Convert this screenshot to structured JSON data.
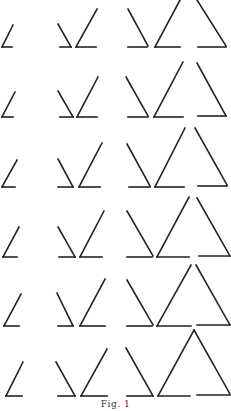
{
  "figure": {
    "caption": "Fig. 1",
    "ink_color": "#222222",
    "background": "#ffffff",
    "rows": [
      {
        "small": [
          [
            13,
            25
          ],
          [
            2,
            47
          ],
          [
            12,
            47
          ]
        ],
        "pair_left": {
          "slant": [
            [
              58,
              24
            ],
            [
              71,
              47
            ]
          ],
          "base": [
            [
              60,
              47
            ],
            [
              71,
              47
            ]
          ]
        },
        "pair_right": {
          "slant": [
            [
              97,
              9
            ],
            [
              76,
              47
            ]
          ],
          "base": [
            [
              76,
              47
            ],
            [
              96,
              47
            ]
          ]
        },
        "tri_left": {
          "slant": [
            [
              128,
              9
            ],
            [
              148,
              46
            ]
          ],
          "base": [
            [
              128,
              47
            ],
            [
              147,
              47
            ]
          ]
        },
        "tri_mid": {
          "slant": [
            [
              180,
              0
            ],
            [
              155,
              47
            ]
          ],
          "base": [
            [
              155,
              47
            ],
            [
              180,
              47
            ]
          ]
        },
        "tri_right": {
          "slant": [
            [
              197,
              0
            ],
            [
              226,
              46
            ]
          ],
          "base": [
            [
              198,
              47
            ],
            [
              226,
              47
            ]
          ]
        }
      },
      {
        "small": [
          [
            15,
            92
          ],
          [
            2,
            117
          ],
          [
            13,
            117
          ]
        ],
        "pair_left": {
          "slant": [
            [
              58,
              91
            ],
            [
              73,
              117
            ]
          ],
          "base": [
            [
              60,
              117
            ],
            [
              73,
              117
            ]
          ]
        },
        "pair_right": {
          "slant": [
            [
              98,
              77
            ],
            [
              77,
              117
            ]
          ],
          "base": [
            [
              77,
              117
            ],
            [
              97,
              117
            ]
          ]
        },
        "tri_left": {
          "slant": [
            [
              126,
              77
            ],
            [
              148,
              116
            ]
          ],
          "base": [
            [
              128,
              117
            ],
            [
              148,
              117
            ]
          ]
        },
        "tri_mid": {
          "slant": [
            [
              183,
              62
            ],
            [
              154,
              117
            ]
          ],
          "base": [
            [
              154,
              117
            ],
            [
              183,
              117
            ]
          ]
        },
        "tri_right": {
          "slant": [
            [
              197,
              63
            ],
            [
              226,
              116
            ]
          ],
          "base": [
            [
              198,
              116
            ],
            [
              226,
              116
            ]
          ]
        }
      },
      {
        "small": [
          [
            17,
            160
          ],
          [
            2,
            187
          ],
          [
            15,
            187
          ]
        ],
        "pair_left": {
          "slant": [
            [
              58,
              159
            ],
            [
              73,
              187
            ]
          ],
          "base": [
            [
              58,
              187
            ],
            [
              73,
              187
            ]
          ]
        },
        "pair_right": {
          "slant": [
            [
              102,
              143
            ],
            [
              79,
              187
            ]
          ],
          "base": [
            [
              79,
              187
            ],
            [
              100,
              187
            ]
          ]
        },
        "tri_left": {
          "slant": [
            [
              127,
              144
            ],
            [
              150,
              186
            ]
          ],
          "base": [
            [
              129,
              187
            ],
            [
              150,
              187
            ]
          ]
        },
        "tri_mid": {
          "slant": [
            [
              185,
              128
            ],
            [
              155,
              187
            ]
          ],
          "base": [
            [
              155,
              187
            ],
            [
              184,
              187
            ]
          ]
        },
        "tri_right": {
          "slant": [
            [
              195,
              128
            ],
            [
              227,
              185
            ]
          ],
          "base": [
            [
              198,
              186
            ],
            [
              227,
              186
            ]
          ]
        }
      },
      {
        "small": [
          [
            19,
            227
          ],
          [
            3,
            257
          ],
          [
            17,
            257
          ]
        ],
        "pair_left": {
          "slant": [
            [
              58,
              227
            ],
            [
              75,
              257
            ]
          ],
          "base": [
            [
              59,
              257
            ],
            [
              75,
              257
            ]
          ]
        },
        "pair_right": {
          "slant": [
            [
              104,
              211
            ],
            [
              80,
              257
            ]
          ],
          "base": [
            [
              80,
              257
            ],
            [
              102,
              257
            ]
          ]
        },
        "tri_left": {
          "slant": [
            [
              127,
              211
            ],
            [
              153,
              256
            ]
          ],
          "base": [
            [
              127,
              257
            ],
            [
              152,
              257
            ]
          ]
        },
        "tri_mid": {
          "slant": [
            [
              189,
              197
            ],
            [
              157,
              257
            ]
          ],
          "base": [
            [
              157,
              257
            ],
            [
              189,
              257
            ]
          ]
        },
        "tri_right": {
          "slant": [
            [
              197,
              198
            ],
            [
              230,
              256
            ]
          ],
          "base": [
            [
              199,
              256
            ],
            [
              230,
              256
            ]
          ]
        }
      },
      {
        "small": [
          [
            21,
            294
          ],
          [
            4,
            326
          ],
          [
            19,
            326
          ]
        ],
        "pair_left": {
          "slant": [
            [
              57,
              293
            ],
            [
              73,
              326
            ]
          ],
          "base": [
            [
              58,
              326
            ],
            [
              73,
              326
            ]
          ]
        },
        "pair_right": {
          "slant": [
            [
              105,
              279
            ],
            [
              80,
              326
            ]
          ],
          "base": [
            [
              80,
              326
            ],
            [
              105,
              326
            ]
          ]
        },
        "tri_left": {
          "slant": [
            [
              127,
              280
            ],
            [
              153,
              325
            ]
          ],
          "base": [
            [
              127,
              326
            ],
            [
              152,
              326
            ]
          ]
        },
        "tri_mid": {
          "slant": [
            [
              191,
              265
            ],
            [
              157,
              326
            ]
          ],
          "base": [
            [
              157,
              326
            ],
            [
              191,
              326
            ]
          ]
        },
        "tri_right": {
          "slant": [
            [
              196,
              265
            ],
            [
              230,
              325
            ]
          ],
          "base": [
            [
              197,
              325
            ],
            [
              230,
              325
            ]
          ]
        }
      },
      {
        "small": [
          [
            23,
            362
          ],
          [
            6,
            396
          ],
          [
            22,
            396
          ]
        ],
        "pair_left": {
          "slant": [
            [
              56,
              362
            ],
            [
              75,
              396
            ]
          ],
          "base": [
            [
              58,
              396
            ],
            [
              75,
              396
            ]
          ]
        },
        "pair_right": {
          "slant": [
            [
              107,
              349
            ],
            [
              81,
              396
            ]
          ],
          "base": [
            [
              81,
              396
            ],
            [
              107,
              396
            ]
          ]
        },
        "tri_left": {
          "slant": [
            [
              126,
              348
            ],
            [
              153,
              396
            ]
          ],
          "base": [
            [
              127,
              396
            ],
            [
              153,
              396
            ]
          ]
        },
        "tri_mid": {
          "slant": [
            [
              194,
              330
            ],
            [
              158,
              396
            ]
          ],
          "base": [
            [
              158,
              396
            ],
            [
              190,
              396
            ]
          ]
        },
        "tri_right": {
          "slant": [
            [
              194,
              330
            ],
            [
              230,
              394
            ]
          ],
          "base": [
            [
              197,
              395
            ],
            [
              230,
              395
            ]
          ]
        }
      }
    ]
  }
}
